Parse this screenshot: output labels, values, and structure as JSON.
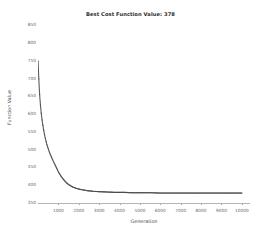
{
  "chart_data": {
    "type": "line",
    "title": "Best Cost Function Value: 378",
    "xlabel": "Generation",
    "ylabel": "Function Value",
    "xlim": [
      0,
      10400
    ],
    "ylim": [
      350,
      860
    ],
    "grid": false,
    "legend": null,
    "line_color": "#5a5a5a",
    "marker_color": "#4a4a4a",
    "xticks": [
      1000,
      2000,
      3000,
      4000,
      5000,
      6000,
      7000,
      8000,
      9000,
      10000
    ],
    "xtick_labels": [
      "1000",
      "2000",
      "3000",
      "4000",
      "5000",
      "6000",
      "7000",
      "8000",
      "9000",
      "10000"
    ],
    "yticks": [
      350,
      400,
      450,
      500,
      550,
      600,
      650,
      700,
      750,
      800,
      850
    ],
    "ytick_labels": [
      "350",
      "400",
      "450",
      "500",
      "550",
      "600",
      "650",
      "700",
      "750",
      "800",
      "850"
    ],
    "series_name": "Best cost per generation",
    "final_value": 378,
    "initial_value": 750,
    "x": [
      0,
      10,
      20,
      30,
      40,
      50,
      60,
      70,
      80,
      90,
      100,
      120,
      140,
      160,
      180,
      200,
      225,
      250,
      275,
      300,
      330,
      360,
      390,
      420,
      450,
      490,
      530,
      570,
      610,
      650,
      700,
      750,
      800,
      850,
      900,
      950,
      1000,
      1100,
      1200,
      1300,
      1400,
      1500,
      1700,
      1900,
      2100,
      2400,
      2700,
      3000,
      3400,
      3800,
      4200,
      4600,
      5000,
      5500,
      6000,
      6500,
      7000,
      7500,
      8000,
      8500,
      9000,
      9500,
      10000
    ],
    "y": [
      750,
      742,
      728,
      712,
      700,
      688,
      676,
      666,
      656,
      648,
      640,
      626,
      614,
      603,
      593,
      584,
      574,
      565,
      556,
      548,
      540,
      532,
      525,
      518,
      512,
      505,
      498,
      492,
      486,
      481,
      474,
      468,
      462,
      456,
      450,
      444,
      438,
      428,
      420,
      413,
      407,
      402,
      395,
      391,
      388,
      385,
      383,
      382,
      381,
      380,
      380,
      379,
      379,
      379,
      378,
      378,
      378,
      378,
      378,
      378,
      378,
      378,
      378
    ]
  }
}
